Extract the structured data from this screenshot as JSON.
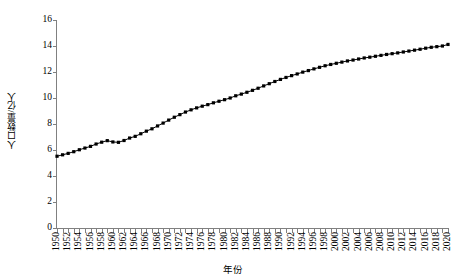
{
  "chart_data": {
    "type": "line",
    "title": "",
    "xlabel": "年份",
    "ylabel": "人口数量/亿人",
    "xlim": [
      1950,
      2020
    ],
    "ylim": [
      0,
      16
    ],
    "yticks": [
      0,
      2,
      4,
      6,
      8,
      10,
      12,
      14,
      16
    ],
    "xtick_step": 2,
    "xtick_minor_step": 1,
    "grid": false,
    "legend": false,
    "marker": "square",
    "series_color": "#000000",
    "background": "#ffffff",
    "axis_color": "#808080",
    "xticklabels": [
      "1950",
      "1952",
      "1954",
      "1956",
      "1958",
      "1960",
      "1962",
      "1964",
      "1966",
      "1968",
      "1970",
      "1972",
      "1974",
      "1976",
      "1978",
      "1980",
      "1982",
      "1984",
      "1986",
      "1988",
      "1990",
      "1992",
      "1994",
      "1996",
      "1998",
      "2000",
      "2002",
      "2004",
      "2006",
      "2008",
      "2010",
      "2012",
      "2014",
      "2016",
      "2018",
      "2020"
    ],
    "x": [
      1950,
      1951,
      1952,
      1953,
      1954,
      1955,
      1956,
      1957,
      1958,
      1959,
      1960,
      1961,
      1962,
      1963,
      1964,
      1965,
      1966,
      1967,
      1968,
      1969,
      1970,
      1971,
      1972,
      1973,
      1974,
      1975,
      1976,
      1977,
      1978,
      1979,
      1980,
      1981,
      1982,
      1983,
      1984,
      1985,
      1986,
      1987,
      1988,
      1989,
      1990,
      1991,
      1992,
      1993,
      1994,
      1995,
      1996,
      1997,
      1998,
      1999,
      2000,
      2001,
      2002,
      2003,
      2004,
      2005,
      2006,
      2007,
      2008,
      2009,
      2010,
      2011,
      2012,
      2013,
      2014,
      2015,
      2016,
      2017,
      2018,
      2019,
      2020
    ],
    "values": [
      5.52,
      5.63,
      5.74,
      5.87,
      6.02,
      6.15,
      6.28,
      6.46,
      6.6,
      6.72,
      6.62,
      6.59,
      6.73,
      6.92,
      7.05,
      7.25,
      7.45,
      7.63,
      7.85,
      8.07,
      8.3,
      8.52,
      8.72,
      8.92,
      9.09,
      9.24,
      9.37,
      9.49,
      9.63,
      9.75,
      9.87,
      10.0,
      10.17,
      10.3,
      10.44,
      10.59,
      10.75,
      10.93,
      11.1,
      11.27,
      11.43,
      11.58,
      11.72,
      11.85,
      11.99,
      12.11,
      12.24,
      12.36,
      12.48,
      12.58,
      12.67,
      12.76,
      12.85,
      12.92,
      13.0,
      13.08,
      13.14,
      13.21,
      13.28,
      13.35,
      13.41,
      13.47,
      13.54,
      13.61,
      13.68,
      13.75,
      13.83,
      13.9,
      13.95,
      14.0,
      14.12
    ]
  }
}
